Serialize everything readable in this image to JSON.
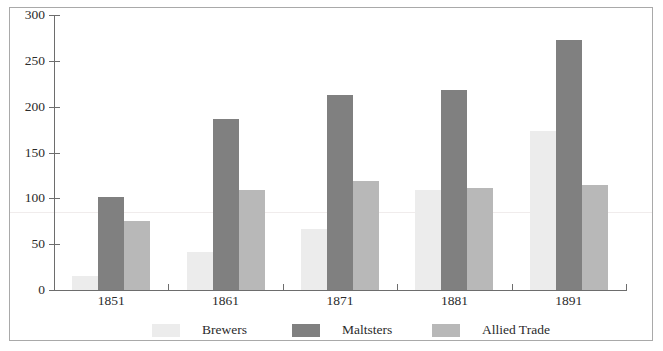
{
  "chart_data": {
    "type": "bar",
    "title": "",
    "subtitle": "",
    "xlabel": "",
    "ylabel": "",
    "categories": [
      "1851",
      "1861",
      "1871",
      "1881",
      "1891"
    ],
    "series": [
      {
        "name": "Brewers",
        "color": "#ececec",
        "values": [
          15,
          42,
          67,
          109,
          174
        ]
      },
      {
        "name": "Maltsters",
        "color": "#808080",
        "values": [
          102,
          187,
          213,
          218,
          273
        ]
      },
      {
        "name": "Allied Trade",
        "color": "#b8b8b8",
        "values": [
          75,
          109,
          119,
          111,
          115
        ]
      }
    ],
    "ylim": [
      0,
      300
    ],
    "ytick_values": [
      0,
      50,
      100,
      150,
      200,
      250,
      300
    ],
    "ytick_labels": [
      "0",
      "50",
      "100",
      "150",
      "200",
      "250",
      "300"
    ],
    "grid": false,
    "legend_position": "bottom",
    "axis_color": "#6d6d6d",
    "text_color": "#2b2b2b",
    "frame_color": "#a9a9a9",
    "background": "#ffffff"
  }
}
